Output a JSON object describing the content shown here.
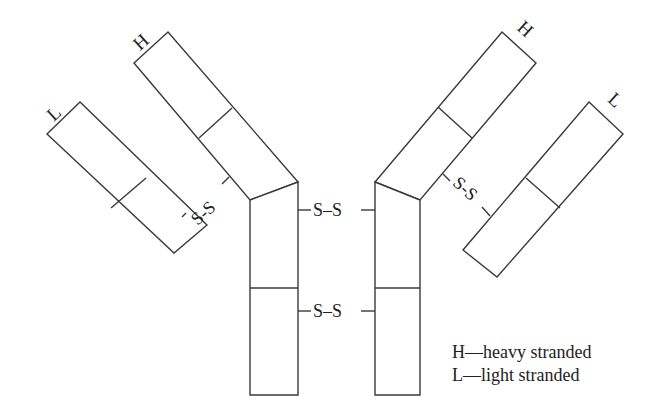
{
  "diagram": {
    "chains": {
      "left_heavy_label": "H",
      "left_light_label": "L",
      "right_heavy_label": "H",
      "right_light_label": "L"
    },
    "bonds": {
      "left_light_heavy": "S-S",
      "right_light_heavy": "S-S",
      "hinge_upper": "S–S",
      "hinge_lower": "S–S"
    },
    "legend": [
      {
        "symbol": "H",
        "text": "H—heavy stranded"
      },
      {
        "symbol": "L",
        "text": "L—light stranded"
      }
    ],
    "colors": {
      "stroke": "#3a3a3a",
      "text": "#222222",
      "background": "#ffffff"
    }
  }
}
